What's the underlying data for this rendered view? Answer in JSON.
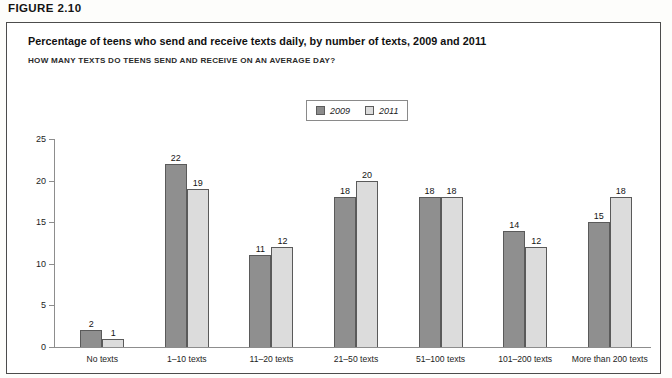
{
  "figure": {
    "label": "FIGURE 2.10",
    "title": "Percentage of teens who send and receive texts daily, by number of texts, 2009 and 2011",
    "subtitle": "HOW MANY TEXTS DO TEENS SEND AND RECEIVE ON AN AVERAGE DAY?"
  },
  "legend": {
    "position": "top-center",
    "entries": [
      {
        "label": "2009",
        "color": "#8f8f8f"
      },
      {
        "label": "2011",
        "color": "#dcdcdc"
      }
    ]
  },
  "axis": {
    "y_ticks": [
      "0",
      "5",
      "10",
      "15",
      "20",
      "25"
    ]
  },
  "chart_data": {
    "type": "bar",
    "title": "Percentage of teens who send and receive texts daily, by number of texts, 2009 and 2011",
    "subtitle": "HOW MANY TEXTS DO TEENS SEND AND RECEIVE ON AN AVERAGE DAY?",
    "xlabel": "",
    "ylabel": "",
    "ylim": [
      0,
      25
    ],
    "ytick_interval": 5,
    "grid": false,
    "legend_position": "top-center",
    "categories": [
      "No texts",
      "1–10 texts",
      "11–20 texts",
      "21–50 texts",
      "51–100 texts",
      "101–200 texts",
      "More than 200 texts"
    ],
    "series": [
      {
        "name": "2009",
        "color": "#8f8f8f",
        "values": [
          2,
          22,
          11,
          18,
          18,
          14,
          15
        ]
      },
      {
        "name": "2011",
        "color": "#dcdcdc",
        "values": [
          1,
          19,
          12,
          20,
          18,
          12,
          18
        ]
      }
    ],
    "data_labels": [
      {
        "category": "No texts",
        "2009": "2",
        "2011": "1"
      },
      {
        "category": "1–10 texts",
        "2009": "22",
        "2011": "19"
      },
      {
        "category": "11–20 texts",
        "2009": "11",
        "2011": "12"
      },
      {
        "category": "21–50 texts",
        "2009": "18",
        "2011": "20"
      },
      {
        "category": "51–100 texts",
        "2009": "18",
        "2011": "18"
      },
      {
        "category": "101–200 texts",
        "2009": "14",
        "2011": "12"
      },
      {
        "category": "More than 200 texts",
        "2009": "15",
        "2011": "18"
      }
    ]
  }
}
